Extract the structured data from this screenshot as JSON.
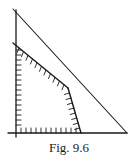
{
  "figure": {
    "caption": "Fig. 9.6",
    "stroke_color": "#1a1a1a",
    "background": "#ffffff",
    "axes": {
      "origin": [
        16,
        133
      ],
      "x_axis": {
        "from": [
          8,
          133
        ],
        "to": [
          127,
          133
        ]
      },
      "y_axis": {
        "from": [
          16,
          10
        ],
        "to": [
          16,
          137
        ]
      }
    },
    "outer_line": {
      "from": [
        13,
        9
      ],
      "to": [
        127,
        133
      ]
    },
    "feasible_region": {
      "vertices": [
        [
          16,
          133
        ],
        [
          16,
          45
        ],
        [
          68,
          88
        ],
        [
          81,
          133
        ]
      ],
      "constraint_segments": [
        {
          "from": [
            13,
            43
          ],
          "to": [
            68,
            88
          ]
        },
        {
          "from": [
            68,
            88
          ],
          "to": [
            81,
            133
          ]
        }
      ],
      "hatched_edges": [
        "x-axis",
        "y-axis",
        "constraint-1",
        "constraint-2"
      ]
    }
  }
}
